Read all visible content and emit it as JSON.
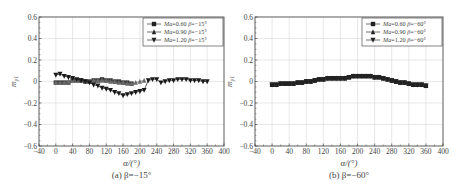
{
  "chart_data": [
    {
      "type": "line",
      "panel": "a",
      "caption": "(a) β=−15°",
      "xlabel": "α/(°)",
      "ylabel": "m_y1",
      "xlim": [
        -40,
        400
      ],
      "ylim": [
        -0.6,
        0.6
      ],
      "xticks": [
        -40,
        0,
        40,
        80,
        120,
        160,
        200,
        240,
        280,
        320,
        360,
        400
      ],
      "yticks": [
        -0.6,
        -0.4,
        -0.2,
        0,
        0.2,
        0.4,
        0.6
      ],
      "ytick_labels": [
        "−0.6",
        "−0.4",
        "−0.2",
        "0",
        "0.2",
        "0.4",
        "0.6"
      ],
      "xtick_labels": [
        "−40",
        "0",
        "40",
        "80",
        "120",
        "160",
        "200",
        "240",
        "280",
        "320",
        "360",
        "400"
      ],
      "grid": true,
      "legend_position": "upper right",
      "legend": [
        "Ma=0.60  β=−15°",
        "Ma=0.90  β=−15°",
        "Ma=1.20  β=−15°"
      ],
      "series": [
        {
          "name": "Ma=0.60 β=−15°",
          "marker": "square",
          "x": [
            0,
            10,
            20,
            30,
            40,
            50,
            60,
            70,
            80,
            90,
            100,
            110,
            120,
            130,
            140,
            150,
            160,
            170,
            180
          ],
          "values": [
            -0.01,
            -0.01,
            -0.01,
            -0.01,
            0.01,
            0.01,
            0.01,
            0.0,
            0.0,
            0.01,
            0.01,
            0.02,
            0.01,
            0.01,
            0.0,
            0.0,
            -0.01,
            -0.01,
            -0.02
          ]
        },
        {
          "name": "Ma=0.90 β=−15°",
          "marker": "triangle-up",
          "x": [
            0,
            10,
            20,
            30,
            40,
            50,
            60,
            70,
            80,
            90,
            100,
            110,
            120,
            130,
            140,
            150,
            160,
            170,
            180,
            190,
            200,
            210
          ],
          "values": [
            -0.01,
            -0.01,
            -0.01,
            0.0,
            0.01,
            0.01,
            0.01,
            0.0,
            0.0,
            0.01,
            0.01,
            0.01,
            0.01,
            0.0,
            0.0,
            -0.01,
            -0.01,
            -0.02,
            -0.02,
            -0.01,
            0.0,
            0.01
          ]
        },
        {
          "name": "Ma=1.20 β=−15°",
          "marker": "triangle-down",
          "x": [
            0,
            10,
            20,
            30,
            40,
            50,
            60,
            70,
            80,
            90,
            100,
            110,
            120,
            130,
            140,
            150,
            160,
            170,
            180,
            190,
            200,
            210,
            220,
            230,
            240,
            250,
            260,
            270,
            280,
            290,
            300,
            310,
            320,
            330,
            340,
            350,
            360
          ],
          "values": [
            0.06,
            0.07,
            0.05,
            0.04,
            0.03,
            0.02,
            0.01,
            0.0,
            -0.01,
            -0.03,
            -0.04,
            -0.06,
            -0.07,
            -0.08,
            -0.1,
            -0.11,
            -0.13,
            -0.12,
            -0.11,
            -0.1,
            -0.09,
            -0.08,
            0.01,
            0.02,
            0.02,
            -0.01,
            0.0,
            0.01,
            0.01,
            0.02,
            0.02,
            0.02,
            0.01,
            0.01,
            0.01,
            0.0,
            0.0
          ]
        }
      ]
    },
    {
      "type": "line",
      "panel": "b",
      "caption": "(b) β=−60°",
      "xlabel": "α/(°)",
      "ylabel": "m_y1",
      "xlim": [
        -40,
        400
      ],
      "ylim": [
        -0.6,
        0.6
      ],
      "xticks": [
        -40,
        0,
        40,
        80,
        120,
        160,
        200,
        240,
        280,
        320,
        360,
        400
      ],
      "yticks": [
        -0.6,
        -0.4,
        -0.2,
        0,
        0.2,
        0.4,
        0.6
      ],
      "ytick_labels": [
        "−0.6",
        "−0.4",
        "−0.2",
        "0",
        "0.2",
        "0.4",
        "0.6"
      ],
      "xtick_labels": [
        "−40",
        "0",
        "40",
        "80",
        "120",
        "160",
        "200",
        "240",
        "280",
        "320",
        "360",
        "400"
      ],
      "grid": true,
      "legend_position": "upper right",
      "legend": [
        "Ma=0.60  β=−60°",
        "Ma=0.90  β=−60°",
        "Ma=1.20  β=−60°"
      ],
      "series": [
        {
          "name": "Ma=0.60 β=−60°",
          "marker": "square",
          "x": [
            0,
            10,
            20,
            30,
            40,
            50,
            60,
            70,
            80,
            90,
            100,
            110,
            120,
            130,
            140,
            150,
            160,
            170,
            180,
            190,
            200,
            210,
            220,
            230,
            240,
            250,
            260,
            270,
            280,
            290,
            300,
            310,
            320,
            330,
            340,
            350,
            360
          ],
          "values": [
            -0.03,
            -0.03,
            -0.02,
            -0.02,
            -0.02,
            -0.02,
            -0.01,
            -0.01,
            0.0,
            0.0,
            0.01,
            0.02,
            0.02,
            0.03,
            0.03,
            0.03,
            0.03,
            0.03,
            0.04,
            0.05,
            0.05,
            0.05,
            0.05,
            0.05,
            0.04,
            0.04,
            0.03,
            0.02,
            0.01,
            0.0,
            -0.01,
            -0.01,
            -0.02,
            -0.03,
            -0.03,
            -0.03,
            -0.04
          ]
        },
        {
          "name": "Ma=0.90 β=−60°",
          "marker": "triangle-up",
          "x": [
            0,
            10,
            20,
            30,
            40,
            50,
            60,
            70,
            80,
            90,
            100,
            110,
            120,
            130,
            140,
            150,
            160,
            170,
            180,
            190,
            200,
            210,
            220,
            230,
            240,
            250,
            260,
            270,
            280,
            290,
            300,
            310,
            320,
            330,
            340,
            350,
            360
          ],
          "values": [
            -0.03,
            -0.03,
            -0.02,
            -0.02,
            -0.02,
            -0.02,
            -0.01,
            -0.01,
            0.0,
            0.0,
            0.01,
            0.02,
            0.02,
            0.03,
            0.03,
            0.03,
            0.03,
            0.03,
            0.04,
            0.05,
            0.05,
            0.05,
            0.05,
            0.05,
            0.04,
            0.04,
            0.03,
            0.02,
            0.01,
            0.0,
            -0.01,
            -0.01,
            -0.02,
            -0.03,
            -0.03,
            -0.03,
            -0.04
          ]
        },
        {
          "name": "Ma=1.20 β=−60°",
          "marker": "triangle-down",
          "x": [
            0,
            10,
            20,
            30,
            40,
            50,
            60,
            70,
            80,
            90,
            100,
            110,
            120,
            130,
            140,
            150,
            160,
            170,
            180,
            190,
            200,
            210,
            220,
            230,
            240,
            250,
            260,
            270,
            280,
            290,
            300,
            310,
            320,
            330,
            340,
            350,
            360
          ],
          "values": [
            -0.03,
            -0.03,
            -0.02,
            -0.02,
            -0.02,
            -0.02,
            -0.01,
            -0.01,
            0.0,
            0.0,
            0.01,
            0.02,
            0.02,
            0.03,
            0.03,
            0.03,
            0.03,
            0.03,
            0.04,
            0.05,
            0.05,
            0.05,
            0.05,
            0.05,
            0.04,
            0.04,
            0.03,
            0.02,
            0.01,
            0.0,
            -0.01,
            -0.01,
            -0.02,
            -0.03,
            -0.03,
            -0.03,
            -0.04
          ]
        }
      ]
    }
  ],
  "layout": {
    "panels": [
      {
        "left": 39,
        "right": 224,
        "top": 17,
        "bottom": 146
      },
      {
        "left": 255,
        "right": 443,
        "top": 17,
        "bottom": 146
      }
    ],
    "colors": {
      "axis": "#333333",
      "grid": "#d8d8d8",
      "series": [
        "#3a3a3a",
        "#6a6a6a",
        "#1a1a1a"
      ]
    }
  }
}
